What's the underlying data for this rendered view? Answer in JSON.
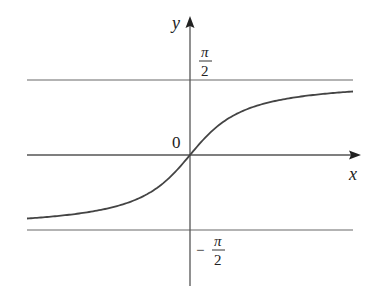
{
  "chart_data": {
    "type": "line",
    "title": "",
    "function": "y = arctan(x)",
    "xlabel": "x",
    "ylabel": "y",
    "origin_label": "0",
    "asymptotes": [
      {
        "y": "π/2",
        "label_num": "π",
        "label_den": "2",
        "sign": ""
      },
      {
        "y": "-π/2",
        "label_num": "π",
        "label_den": "2",
        "sign": "−"
      }
    ],
    "grid": false,
    "legend": null
  },
  "colors": {
    "curve": "#444444",
    "axis": "#444444",
    "asymptote": "#999999"
  }
}
